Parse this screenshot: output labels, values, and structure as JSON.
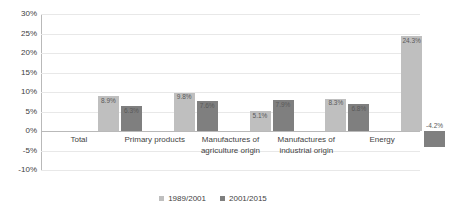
{
  "chart_data": {
    "type": "bar",
    "title": "",
    "xlabel": "",
    "ylabel": "",
    "ylim": [
      -10,
      30
    ],
    "ytick_step": 5,
    "grid": true,
    "legend_position": "bottom-center",
    "ytick_labels": [
      "30%",
      "25%",
      "20%",
      "15%",
      "10%",
      "5%",
      "0%",
      "-5%",
      "-10%"
    ],
    "ytick_values": [
      30,
      25,
      20,
      15,
      10,
      5,
      0,
      -5,
      -10
    ],
    "categories": [
      "Total",
      "Primary products",
      "Manufactures of agriculture origin",
      "Manufactures of industrial origin",
      "Energy"
    ],
    "category_lines": [
      [
        "Total"
      ],
      [
        "Primary products"
      ],
      [
        "Manufactures of",
        "agriculture origin"
      ],
      [
        "Manufactures of",
        "industrial origin"
      ],
      [
        "Energy"
      ]
    ],
    "series": [
      {
        "name": "1989/2001",
        "color": "#bfbfbf",
        "values": [
          8.9,
          9.8,
          5.1,
          8.3,
          24.3
        ],
        "labels": [
          "8.9%",
          "9.8%",
          "5.1%",
          "8.3%",
          "24.3%"
        ]
      },
      {
        "name": "2001/2015",
        "color": "#7f7f7f",
        "values": [
          6.3,
          7.6,
          7.9,
          6.8,
          -4.2
        ],
        "labels": [
          "6.3%",
          "7.6%",
          "7.9%",
          "6.8%",
          "-4.2%"
        ]
      }
    ]
  },
  "legend": {
    "items": [
      {
        "label": "1989/2001"
      },
      {
        "label": "2001/2015"
      }
    ]
  },
  "top_ghost": {
    "text": ""
  }
}
